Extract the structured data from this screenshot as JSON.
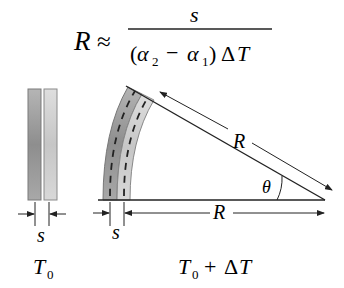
{
  "formula": {
    "lhs": "R",
    "relation": "≈",
    "numerator": "s",
    "denominator_open": "(",
    "alpha2": "α",
    "alpha2_sub": "2",
    "minus": "−",
    "alpha1": "α",
    "alpha1_sub": "1",
    "denominator_close": ")",
    "delta": "Δ",
    "T": "T"
  },
  "left_panel": {
    "thickness_label": "s",
    "temp_label": "T",
    "temp_sub": "0"
  },
  "right_panel": {
    "thickness_label": "s",
    "radius_label_diagonal": "R",
    "radius_label_horizontal": "R",
    "angle_label": "θ",
    "temp_label_T": "T",
    "temp_label_sub": "0",
    "temp_label_plus": "+",
    "temp_label_delta": "Δ",
    "temp_label_T2": "T"
  },
  "colors": {
    "line": "#222222",
    "strip_dark": "#9a9a9a",
    "strip_light": "#d4d4d4",
    "strip_edge": "#7a7a7a"
  }
}
